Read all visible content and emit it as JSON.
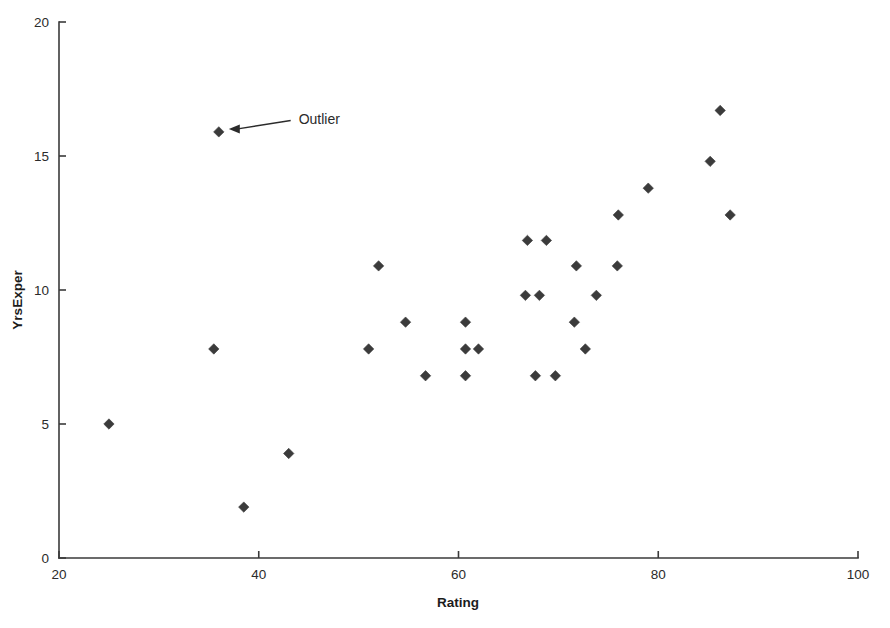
{
  "chart_data": {
    "type": "scatter",
    "title": "",
    "xlabel": "Rating",
    "ylabel": "YrsExper",
    "xlim": [
      20,
      100
    ],
    "ylim": [
      0,
      20
    ],
    "xticks": [
      20,
      40,
      60,
      80,
      100
    ],
    "yticks": [
      0,
      5,
      10,
      15,
      20
    ],
    "xtick_labels": [
      "20",
      "40",
      "60",
      "80",
      "100"
    ],
    "ytick_labels": [
      "0",
      "5",
      "10",
      "15",
      "20"
    ],
    "grid": false,
    "legend": null,
    "marker": "diamond",
    "marker_color": "#3b3b3b",
    "points": [
      {
        "x": 25.0,
        "y": 5.0
      },
      {
        "x": 35.5,
        "y": 7.8
      },
      {
        "x": 36.0,
        "y": 15.9
      },
      {
        "x": 38.5,
        "y": 1.9
      },
      {
        "x": 43.0,
        "y": 3.9
      },
      {
        "x": 51.0,
        "y": 7.8
      },
      {
        "x": 52.0,
        "y": 10.9
      },
      {
        "x": 54.7,
        "y": 8.8
      },
      {
        "x": 56.7,
        "y": 6.8
      },
      {
        "x": 60.7,
        "y": 8.8
      },
      {
        "x": 60.7,
        "y": 6.8
      },
      {
        "x": 60.7,
        "y": 7.8
      },
      {
        "x": 62.0,
        "y": 7.8
      },
      {
        "x": 66.7,
        "y": 9.8
      },
      {
        "x": 68.1,
        "y": 9.8
      },
      {
        "x": 66.9,
        "y": 11.85
      },
      {
        "x": 68.8,
        "y": 11.85
      },
      {
        "x": 67.7,
        "y": 6.8
      },
      {
        "x": 69.7,
        "y": 6.8
      },
      {
        "x": 71.8,
        "y": 10.9
      },
      {
        "x": 71.6,
        "y": 8.8
      },
      {
        "x": 73.8,
        "y": 9.8
      },
      {
        "x": 72.7,
        "y": 7.8
      },
      {
        "x": 75.9,
        "y": 10.9
      },
      {
        "x": 76.0,
        "y": 12.8
      },
      {
        "x": 79.0,
        "y": 13.8
      },
      {
        "x": 85.2,
        "y": 14.8
      },
      {
        "x": 86.2,
        "y": 16.7
      },
      {
        "x": 87.2,
        "y": 12.8
      }
    ],
    "annotations": [
      {
        "label": "Outlier",
        "points_to": {
          "x": 36.0,
          "y": 15.9
        },
        "text_x": 44.0,
        "text_y": 16.4
      }
    ]
  }
}
